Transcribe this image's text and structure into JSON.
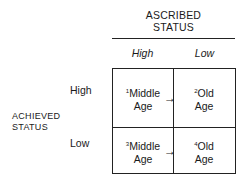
{
  "column_axis": {
    "title_line1": "ASCRIBED",
    "title_line2": "STATUS",
    "headers": [
      "High",
      "Low"
    ]
  },
  "row_axis": {
    "title_line1": "ACHIEVED",
    "title_line2": "STATUS",
    "headers": [
      "High",
      "Low"
    ]
  },
  "cells": [
    {
      "num": "1",
      "line1": "Middle",
      "line2": "Age"
    },
    {
      "num": "2",
      "line1": "Old",
      "line2": "Age"
    },
    {
      "num": "3",
      "line1": "Middle",
      "line2": "Age"
    },
    {
      "num": "4",
      "line1": "Old",
      "line2": "Age"
    }
  ],
  "arrow_glyph": "→"
}
